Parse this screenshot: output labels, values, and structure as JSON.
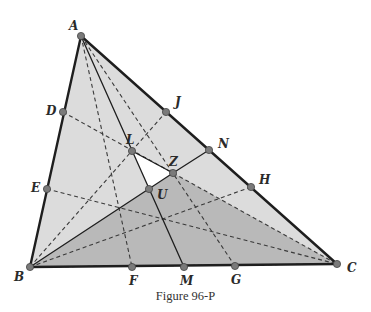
{
  "figure": {
    "caption": "Figure 96-P",
    "colors": {
      "light_fill": "#dcdcdc",
      "dark_fill": "#b9b9b9",
      "hole_fill": "#ffffff",
      "edge": "#1e1e1e",
      "point": "#7a7a7a"
    },
    "points": {
      "A": {
        "label": "A",
        "x": 81,
        "y": 36
      },
      "B": {
        "label": "B",
        "x": 30,
        "y": 267
      },
      "C": {
        "label": "C",
        "x": 337,
        "y": 264
      },
      "D": {
        "label": "D",
        "x": 63,
        "y": 112
      },
      "E": {
        "label": "E",
        "x": 47,
        "y": 189
      },
      "J": {
        "label": "J",
        "x": 166,
        "y": 112
      },
      "N": {
        "label": "N",
        "x": 209,
        "y": 150
      },
      "H": {
        "label": "H",
        "x": 251,
        "y": 187
      },
      "F": {
        "label": "F",
        "x": 132,
        "y": 267
      },
      "M": {
        "label": "M",
        "x": 184,
        "y": 267
      },
      "G": {
        "label": "G",
        "x": 235,
        "y": 266
      },
      "L": {
        "label": "L",
        "x": 132,
        "y": 151
      },
      "Z": {
        "label": "Z",
        "x": 173,
        "y": 173
      },
      "U": {
        "label": "U",
        "x": 149,
        "y": 189
      }
    },
    "regions": [
      {
        "name": "triangle-ABC",
        "shade": "light",
        "vertices": [
          "A",
          "B",
          "C"
        ]
      },
      {
        "name": "triangle-BZC",
        "shade": "dark",
        "vertices": [
          "B",
          "Z",
          "C"
        ]
      },
      {
        "name": "triangle-LZU",
        "shade": "white",
        "vertices": [
          "L",
          "Z",
          "U"
        ]
      }
    ],
    "solid_segments": [
      [
        "A",
        "B"
      ],
      [
        "B",
        "C"
      ],
      [
        "C",
        "A"
      ],
      [
        "A",
        "M"
      ],
      [
        "B",
        "Z"
      ],
      [
        "Z",
        "N"
      ],
      [
        "L",
        "Z"
      ]
    ],
    "dashed_segments": [
      [
        "A",
        "F"
      ],
      [
        "A",
        "G"
      ],
      [
        "D",
        "C"
      ],
      [
        "E",
        "C"
      ],
      [
        "B",
        "J"
      ],
      [
        "B",
        "H"
      ],
      [
        "B",
        "C"
      ]
    ]
  }
}
